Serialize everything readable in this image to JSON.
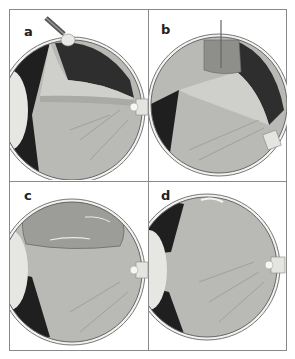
{
  "figure": {
    "type": "medical-illustration",
    "panels": [
      {
        "label": "a",
        "description": "detached retina with instrument at top of eye"
      },
      {
        "label": "b",
        "description": "gas bubble injected with needle, eye tilted"
      },
      {
        "label": "c",
        "description": "large gas bubble pressing retina"
      },
      {
        "label": "d",
        "description": "retina reattached"
      }
    ]
  },
  "colors": {
    "frame": "#8a8a8a",
    "sclera": "#f2f2f0",
    "retina": "#b8b8b4",
    "choroid_dark": "#2a2a2a",
    "detached_fold": "#c8c8c4",
    "bubble": "#9a9a98"
  }
}
